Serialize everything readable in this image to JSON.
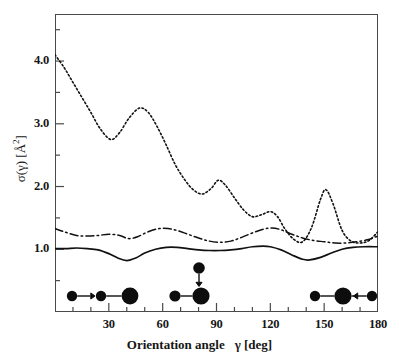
{
  "chart_data": {
    "type": "line",
    "title": "",
    "xlabel": "Orientation angle   γ [deg]",
    "ylabel": "σ(γ) [Å²]",
    "xlim": [
      0,
      180
    ],
    "ylim": [
      0.0,
      4.75
    ],
    "grid": false,
    "legend": "none",
    "xticks": [
      30,
      60,
      90,
      120,
      150,
      180
    ],
    "xtick_labels": [
      "30",
      "60",
      "90",
      "120",
      "150",
      "180"
    ],
    "xminor_ticks": [
      10,
      20,
      40,
      50,
      70,
      80,
      100,
      110,
      130,
      140,
      160,
      170
    ],
    "yticks": [
      1.0,
      2.0,
      3.0,
      4.0
    ],
    "ytick_labels": [
      "1.0",
      "2.0",
      "3.0",
      "4.0"
    ],
    "series": [
      {
        "name": "dotted",
        "style": "dotted",
        "x": [
          0,
          5,
          10,
          15,
          20,
          25,
          31,
          36,
          41,
          47,
          52,
          57,
          62,
          67,
          72,
          77,
          82,
          87,
          91,
          95,
          100,
          105,
          110,
          115,
          120,
          124,
          128,
          133,
          138,
          143,
          148,
          151,
          155,
          160,
          165,
          170,
          175,
          180
        ],
        "y": [
          4.1,
          3.9,
          3.66,
          3.42,
          3.18,
          2.93,
          2.75,
          2.86,
          3.08,
          3.25,
          3.18,
          2.95,
          2.66,
          2.35,
          2.12,
          1.95,
          1.88,
          1.97,
          2.1,
          2.02,
          1.82,
          1.63,
          1.52,
          1.55,
          1.6,
          1.52,
          1.33,
          1.16,
          1.12,
          1.35,
          1.8,
          1.95,
          1.72,
          1.3,
          1.13,
          1.1,
          1.14,
          1.28
        ]
      },
      {
        "name": "dash-dot",
        "style": "dashdot",
        "x": [
          0,
          6,
          12,
          18,
          24,
          30,
          36,
          41,
          46,
          52,
          58,
          63,
          68,
          74,
          80,
          86,
          92,
          98,
          104,
          110,
          116,
          121,
          126,
          132,
          138,
          144,
          150,
          156,
          162,
          168,
          174,
          180
        ],
        "y": [
          1.33,
          1.27,
          1.22,
          1.21,
          1.22,
          1.24,
          1.22,
          1.17,
          1.2,
          1.28,
          1.33,
          1.33,
          1.3,
          1.24,
          1.18,
          1.13,
          1.11,
          1.13,
          1.19,
          1.26,
          1.32,
          1.34,
          1.31,
          1.24,
          1.18,
          1.14,
          1.12,
          1.1,
          1.1,
          1.12,
          1.15,
          1.21
        ]
      },
      {
        "name": "solid",
        "style": "solid",
        "x": [
          0,
          6,
          12,
          18,
          24,
          30,
          35,
          40,
          45,
          50,
          56,
          62,
          68,
          74,
          80,
          86,
          92,
          98,
          104,
          110,
          116,
          120,
          126,
          132,
          138,
          142,
          148,
          154,
          160,
          166,
          172,
          180
        ],
        "y": [
          1.01,
          1.01,
          1.02,
          1.01,
          0.99,
          0.93,
          0.86,
          0.82,
          0.86,
          0.94,
          1.0,
          1.03,
          1.03,
          1.01,
          0.99,
          0.98,
          0.98,
          0.99,
          1.01,
          1.04,
          1.05,
          1.04,
          0.99,
          0.91,
          0.84,
          0.83,
          0.87,
          0.94,
          1.0,
          1.03,
          1.04,
          1.04
        ]
      }
    ],
    "annotations": [
      {
        "name": "collinear-geometry-0deg",
        "at_angle": 0,
        "description": "small atom with arrow pointing right toward a diatomic molecule (medium and large spheres)"
      },
      {
        "name": "perpendicular-geometry-90deg",
        "at_angle": 90,
        "description": "atom above with arrow pointing down onto a diatomic molecule (medium and large spheres)"
      },
      {
        "name": "collinear-geometry-180deg",
        "at_angle": 180,
        "description": "diatomic molecule (medium and large spheres) with an atom approaching from the right via a left-pointing arrow"
      }
    ]
  },
  "axes": {
    "y_title": "σ(γ) [Å",
    "y_title_sup": "2",
    "y_title_tail": "]",
    "x_title_main": "Orientation angle",
    "x_title_symbol": "γ [deg]"
  },
  "colors": {
    "frame": "#4a4a4a",
    "curve": "#111111",
    "text": "#161616",
    "background": "#ffffff"
  }
}
